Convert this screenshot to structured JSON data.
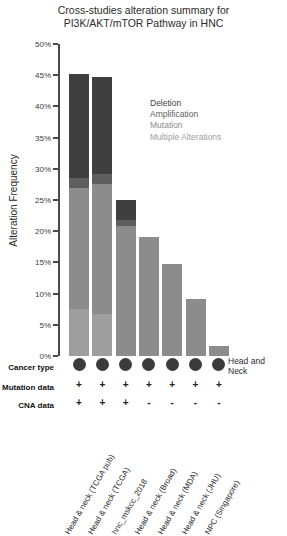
{
  "title": {
    "line1": "Cross-studies alteration summary for",
    "line2": "PI3K/AKT/mTOR Pathway in HNC"
  },
  "axis": {
    "ylabel": "Alteration Frequency",
    "ticks": [
      "50%",
      "45%",
      "40%",
      "35%",
      "30%",
      "25%",
      "20%",
      "15%",
      "10%",
      "5%",
      "0%"
    ]
  },
  "legend": {
    "items": [
      {
        "label": "Deletion",
        "color": "#3f3f3f"
      },
      {
        "label": "Amplification",
        "color": "#5e5e5e"
      },
      {
        "label": "Mutation",
        "color": "#8c8c8c"
      },
      {
        "label": "Multiple Alterations",
        "color": "#9e9e9e"
      }
    ]
  },
  "annotations": {
    "cancer_type_label": "Cancer type",
    "mutation_data_label": "Mutation data",
    "cna_data_label": "CNA data",
    "cancer_type_side_line1": "Head and",
    "cancer_type_side_line2": "Neck",
    "cancer_type_values": [
      "dot",
      "dot",
      "dot",
      "dot",
      "dot",
      "dot",
      "dot"
    ],
    "mutation_data_values": [
      "+",
      "+",
      "+",
      "+",
      "+",
      "+",
      "+"
    ],
    "cna_data_values": [
      "+",
      "+",
      "+",
      "-",
      "-",
      "-",
      "-"
    ]
  },
  "chart_data": {
    "type": "bar",
    "title": "Cross-studies alteration summary for PI3K/AKT/mTOR Pathway in HNC",
    "xlabel": "",
    "ylabel": "Alteration Frequency",
    "ylim": [
      0,
      50
    ],
    "yunit": "%",
    "grid": false,
    "stacked": true,
    "legend_position": "inside-top-right",
    "categories": [
      "Head & neck (TCGA pub)",
      "Head & neck (TCGA)",
      "hnc_mskcc_2018",
      "Head & neck (Broad)",
      "Head & neck (MDA)",
      "Head & neck (JHU)",
      "NPC (Singapore)"
    ],
    "series": [
      {
        "name": "Deletion",
        "color": "#3f3f3f",
        "values": [
          16.7,
          15.5,
          3.2,
          0,
          0,
          0,
          0
        ]
      },
      {
        "name": "Amplification",
        "color": "#5e5e5e",
        "values": [
          1.5,
          1.7,
          0.9,
          0,
          0,
          0,
          0
        ]
      },
      {
        "name": "Mutation",
        "color": "#8c8c8c",
        "values": [
          19.5,
          20.7,
          20.9,
          19.0,
          14.8,
          9.2,
          1.6
        ]
      },
      {
        "name": "Multiple Alterations",
        "color": "#9e9e9e",
        "values": [
          7.5,
          6.8,
          0,
          0,
          0,
          0,
          0
        ]
      }
    ],
    "totals": [
      45.2,
      44.7,
      25.0,
      19.0,
      14.8,
      9.2,
      1.6
    ]
  }
}
